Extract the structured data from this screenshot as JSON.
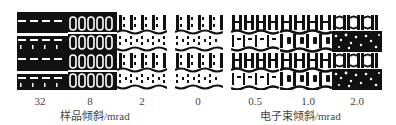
{
  "figure": {
    "groups": [
      {
        "axis_label": "样品倾斜/mrad",
        "panels": [
          {
            "label": "32",
            "pattern": "dark-dashes"
          },
          {
            "label": "8",
            "pattern": "ring-columns"
          },
          {
            "label": "2",
            "pattern": "dot-columns-wavy"
          }
        ]
      },
      {
        "axis_label": "电子束倾斜/mrad",
        "panels": [
          {
            "label": "0",
            "pattern": "dot-columns-wavy"
          },
          {
            "label": "0.5",
            "pattern": "ladder-columns"
          },
          {
            "label": "1.0",
            "pattern": "ladder-columns-strong"
          },
          {
            "label": "2.0",
            "pattern": "arc-columns-speckled"
          }
        ]
      }
    ],
    "tick_labels": [
      "32",
      "8",
      "2",
      "0",
      "0.5",
      "1.0",
      "2.0"
    ],
    "x_axis_labels": [
      "样品倾斜/mrad",
      "电子束倾斜/mrad"
    ],
    "colors": {
      "ink": "#111111",
      "paper": "#ffffff",
      "label": "#444444"
    }
  }
}
